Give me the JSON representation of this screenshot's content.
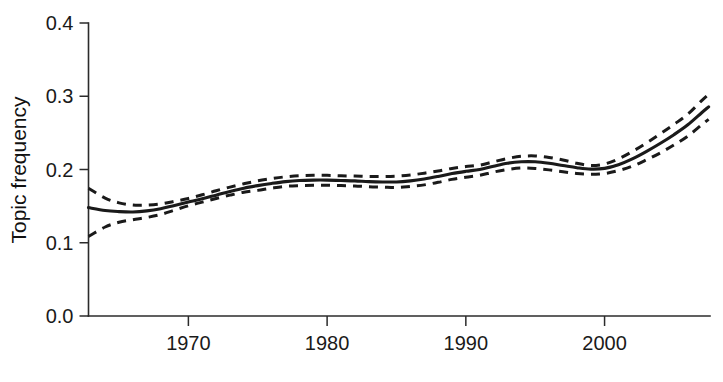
{
  "chart_data": {
    "type": "line",
    "title": "",
    "subtitle": "",
    "xlabel": "",
    "ylabel": "Topic frequency",
    "xlim": [
      1962.8,
      2007.6
    ],
    "ylim": [
      0.0,
      0.4
    ],
    "grid": false,
    "legend": null,
    "x_ticks": [
      1970,
      1980,
      1990,
      2000
    ],
    "x_tick_labels": [
      "1970",
      "1980",
      "1990",
      "2000"
    ],
    "y_ticks": [
      0.0,
      0.1,
      0.2,
      0.3,
      0.4
    ],
    "y_tick_labels": [
      "0.0",
      "0.1",
      "0.2",
      "0.3",
      "0.4"
    ],
    "x": [
      1962.8,
      1964,
      1965,
      1966,
      1967,
      1968,
      1969,
      1970,
      1971,
      1972,
      1973,
      1974,
      1975,
      1976,
      1977,
      1978,
      1979,
      1980,
      1981,
      1982,
      1983,
      1984,
      1985,
      1986,
      1987,
      1988,
      1989,
      1990,
      1991,
      1992,
      1993,
      1994,
      1995,
      1996,
      1997,
      1998,
      1999,
      2000,
      2001,
      2002,
      2003,
      2004,
      2005,
      2006,
      2007,
      2007.5
    ],
    "series": [
      {
        "name": "Topic frequency (fitted)",
        "style": "solid",
        "values": [
          0.148,
          0.144,
          0.1425,
          0.142,
          0.1435,
          0.1465,
          0.151,
          0.1555,
          0.16,
          0.165,
          0.17,
          0.1745,
          0.178,
          0.181,
          0.1835,
          0.185,
          0.1855,
          0.1855,
          0.185,
          0.1845,
          0.1835,
          0.183,
          0.183,
          0.1845,
          0.187,
          0.1905,
          0.1945,
          0.1975,
          0.2,
          0.2045,
          0.2085,
          0.2105,
          0.2105,
          0.2085,
          0.2055,
          0.2025,
          0.2005,
          0.2015,
          0.2065,
          0.2145,
          0.2245,
          0.2355,
          0.2475,
          0.261,
          0.2775,
          0.2855
        ]
      },
      {
        "name": "Upper confidence bound",
        "style": "dashed",
        "values": [
          0.1745,
          0.161,
          0.1545,
          0.1515,
          0.1515,
          0.153,
          0.1565,
          0.1605,
          0.1655,
          0.171,
          0.176,
          0.1805,
          0.1845,
          0.1875,
          0.19,
          0.1915,
          0.192,
          0.192,
          0.1915,
          0.191,
          0.1905,
          0.1905,
          0.191,
          0.1925,
          0.195,
          0.198,
          0.2015,
          0.204,
          0.206,
          0.2105,
          0.215,
          0.218,
          0.2185,
          0.2165,
          0.213,
          0.2085,
          0.2055,
          0.2075,
          0.2145,
          0.2245,
          0.236,
          0.2485,
          0.2615,
          0.2755,
          0.294,
          0.3025
        ]
      },
      {
        "name": "Lower confidence bound",
        "style": "dashed",
        "values": [
          0.1085,
          0.1215,
          0.128,
          0.1315,
          0.1345,
          0.1385,
          0.1445,
          0.1505,
          0.1555,
          0.1605,
          0.165,
          0.169,
          0.1715,
          0.1745,
          0.177,
          0.178,
          0.1785,
          0.1785,
          0.178,
          0.1775,
          0.1765,
          0.176,
          0.1755,
          0.177,
          0.179,
          0.1825,
          0.1865,
          0.1895,
          0.192,
          0.1965,
          0.2,
          0.202,
          0.2015,
          0.1995,
          0.197,
          0.1945,
          0.1935,
          0.1945,
          0.1985,
          0.2045,
          0.213,
          0.2225,
          0.2335,
          0.2455,
          0.261,
          0.2685
        ]
      }
    ]
  },
  "colors": {
    "axis": "#2b2b2b",
    "line": "#1a1a1a",
    "background": "#ffffff"
  }
}
